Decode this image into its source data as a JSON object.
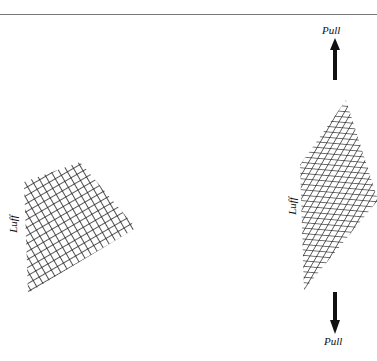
{
  "figure": {
    "left_panel": {
      "side_label": "Luff"
    },
    "right_panel": {
      "side_label": "Luff",
      "top_label": "Pull",
      "bottom_label": "Pull"
    },
    "colors": {
      "line": "#222222",
      "rule": "#777777"
    }
  }
}
